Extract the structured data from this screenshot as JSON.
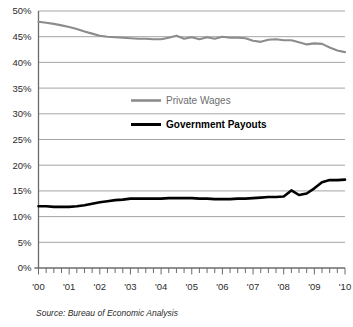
{
  "chart_data": {
    "type": "line",
    "title": "",
    "subtitle": "",
    "xlabel": "",
    "ylabel": "",
    "xlim": [
      2000,
      2010
    ],
    "ylim": [
      0,
      50
    ],
    "grid": true,
    "legend_position": "center-inside",
    "y_ticks": [
      "0%",
      "5%",
      "10%",
      "15%",
      "20%",
      "25%",
      "30%",
      "35%",
      "40%",
      "45%",
      "50%"
    ],
    "y_tick_values": [
      0,
      5,
      10,
      15,
      20,
      25,
      30,
      35,
      40,
      45,
      50
    ],
    "x_ticks": [
      "'00",
      "'01",
      "'02",
      "'03",
      "'04",
      "'05",
      "'06",
      "'07",
      "'08",
      "'09",
      "'10"
    ],
    "x_tick_values": [
      2000,
      2001,
      2002,
      2003,
      2004,
      2005,
      2006,
      2007,
      2008,
      2009,
      2010
    ],
    "minor_ticks_per_interval": 4,
    "x": [
      2000.0,
      2000.25,
      2000.5,
      2000.75,
      2001.0,
      2001.25,
      2001.5,
      2001.75,
      2002.0,
      2002.25,
      2002.5,
      2002.75,
      2003.0,
      2003.25,
      2003.5,
      2003.75,
      2004.0,
      2004.25,
      2004.5,
      2004.75,
      2005.0,
      2005.25,
      2005.5,
      2005.75,
      2006.0,
      2006.25,
      2006.5,
      2006.75,
      2007.0,
      2007.25,
      2007.5,
      2007.75,
      2008.0,
      2008.25,
      2008.5,
      2008.75,
      2009.0,
      2009.25,
      2009.5,
      2009.75,
      2010.0
    ],
    "series": [
      {
        "name": "Private Wages",
        "color": "#8c8c8c",
        "values": [
          47.9,
          47.7,
          47.5,
          47.2,
          46.9,
          46.5,
          46.0,
          45.6,
          45.2,
          45.0,
          44.9,
          44.8,
          44.7,
          44.6,
          44.6,
          44.5,
          44.5,
          44.8,
          45.2,
          44.6,
          44.9,
          44.5,
          44.9,
          44.6,
          45.0,
          44.8,
          44.8,
          44.7,
          44.2,
          44.0,
          44.4,
          44.5,
          44.3,
          44.3,
          43.9,
          43.5,
          43.7,
          43.6,
          42.9,
          42.3,
          42.0
        ]
      },
      {
        "name": "Government Payouts",
        "color": "#000000",
        "values": [
          12.0,
          12.0,
          11.9,
          11.9,
          11.9,
          12.0,
          12.2,
          12.5,
          12.8,
          13.0,
          13.2,
          13.3,
          13.5,
          13.5,
          13.5,
          13.5,
          13.5,
          13.6,
          13.6,
          13.6,
          13.6,
          13.5,
          13.5,
          13.4,
          13.4,
          13.4,
          13.5,
          13.5,
          13.6,
          13.7,
          13.8,
          13.8,
          13.9,
          15.1,
          14.2,
          14.5,
          15.5,
          16.7,
          17.1,
          17.1,
          17.2
        ]
      }
    ]
  },
  "legend": {
    "items": [
      {
        "label": "Private Wages",
        "color": "#8c8c8c"
      },
      {
        "label": "Government Payouts",
        "color": "#000000"
      }
    ]
  },
  "footer": {
    "source": "Source:  Bureau of Economic Analysis"
  }
}
